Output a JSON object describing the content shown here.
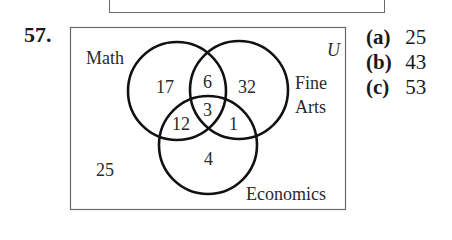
{
  "problem": {
    "number": "57."
  },
  "venn": {
    "universe_label": "U",
    "sets": [
      {
        "name": "Math",
        "label": "Math"
      },
      {
        "name": "Fine Arts",
        "label_line1": "Fine",
        "label_line2": "Arts"
      },
      {
        "name": "Economics",
        "label": "Economics"
      }
    ],
    "regions": {
      "math_only": "17",
      "math_finearts_only": "6",
      "finearts_only": "32",
      "all_three": "3",
      "math_economics_only": "12",
      "finearts_economics_only": "1",
      "economics_only": "4",
      "outside": "25"
    }
  },
  "answers": [
    {
      "label": "(a)",
      "value": "25"
    },
    {
      "label": "(b)",
      "value": "43"
    },
    {
      "label": "(c)",
      "value": "53"
    }
  ]
}
